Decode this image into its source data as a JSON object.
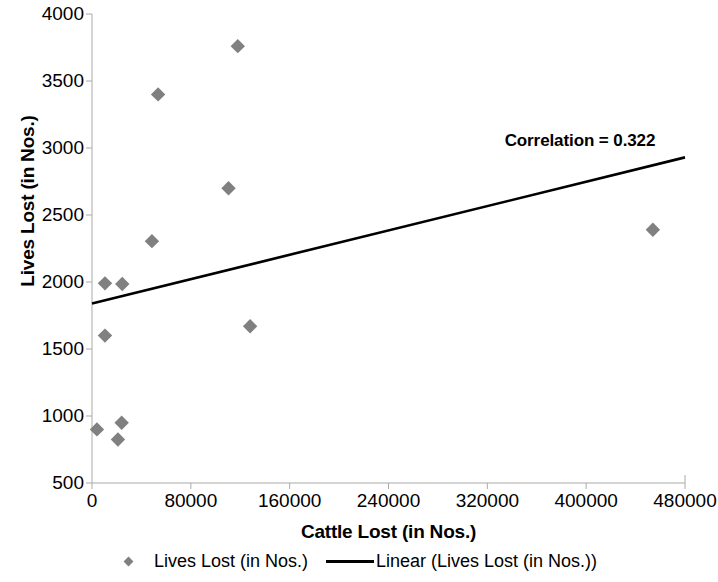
{
  "chart_data": {
    "type": "scatter",
    "title": "",
    "xlabel": "Cattle Lost (in Nos.)",
    "ylabel": "Lives Lost (in Nos.)",
    "xlim": [
      0,
      480000
    ],
    "ylim": [
      500,
      4000
    ],
    "xticks": [
      0,
      80000,
      160000,
      240000,
      320000,
      400000,
      480000
    ],
    "xtick_labels": [
      "0",
      "80000",
      "160000",
      "240000",
      "320000",
      "400000",
      "480000"
    ],
    "yticks": [
      500,
      1000,
      1500,
      2000,
      2500,
      3000,
      3500,
      4000
    ],
    "ytick_labels": [
      "500",
      "1000",
      "1500",
      "2000",
      "2500",
      "3000",
      "3500",
      "4000"
    ],
    "grid": false,
    "legend_position": "bottom",
    "marker_color": "#808080",
    "line_color": "#000000",
    "series": [
      {
        "name": "Lives Lost (in Nos.)",
        "type": "scatter",
        "points": [
          {
            "x": 4000,
            "y": 900
          },
          {
            "x": 10500,
            "y": 1600
          },
          {
            "x": 10500,
            "y": 1990
          },
          {
            "x": 21000,
            "y": 825
          },
          {
            "x": 24000,
            "y": 950
          },
          {
            "x": 24500,
            "y": 1985
          },
          {
            "x": 48500,
            "y": 2305
          },
          {
            "x": 53500,
            "y": 3400
          },
          {
            "x": 110500,
            "y": 2700
          },
          {
            "x": 118000,
            "y": 3760
          },
          {
            "x": 128000,
            "y": 1670
          },
          {
            "x": 454000,
            "y": 2390
          }
        ]
      },
      {
        "name": "Linear (Lives Lost (in Nos.))",
        "type": "line",
        "points": [
          {
            "x": 0,
            "y": 1840
          },
          {
            "x": 480000,
            "y": 2930
          }
        ]
      }
    ],
    "annotations": [
      {
        "text": "Correlation = 0.322",
        "x": 395000,
        "y": 3050
      }
    ]
  },
  "legend": {
    "entries": [
      {
        "label": "Lives Lost (in Nos.)",
        "marker": "diamond-marker"
      },
      {
        "label": "Linear (Lives Lost (in Nos.))",
        "marker": "line-marker"
      }
    ]
  }
}
